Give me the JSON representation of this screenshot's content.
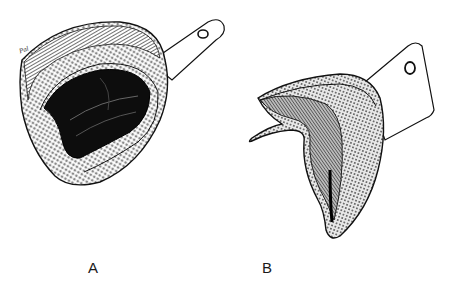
{
  "figures": [
    {
      "id": "A",
      "label": "A",
      "subject": "maxillary perforated impression tray",
      "signature": "Pal"
    },
    {
      "id": "B",
      "label": "B",
      "subject": "mandibular perforated impression tray"
    }
  ],
  "colors": {
    "ink": "#111111",
    "background": "#ffffff"
  }
}
